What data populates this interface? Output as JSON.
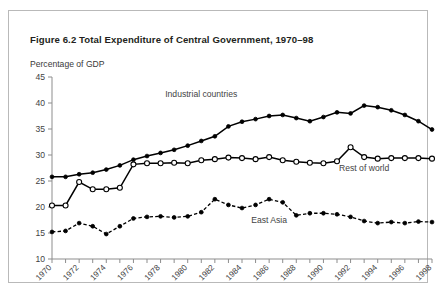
{
  "figure": {
    "title": "Figure 6.2  Total Expenditure of Central Government, 1970–98",
    "subtitle": "Percentage of GDP"
  },
  "chart_data": {
    "type": "line",
    "title": "Figure 6.2  Total Expenditure of Central Government, 1970–98",
    "subtitle": "Percentage of GDP",
    "xlabel": "",
    "ylabel": "Percentage of GDP",
    "ylim": [
      10,
      45
    ],
    "yticks": [
      10,
      15,
      20,
      25,
      30,
      35,
      40,
      45
    ],
    "xlim": [
      1970,
      1998
    ],
    "x": [
      1970,
      1971,
      1972,
      1973,
      1974,
      1975,
      1976,
      1977,
      1978,
      1979,
      1980,
      1981,
      1982,
      1983,
      1984,
      1985,
      1986,
      1987,
      1988,
      1989,
      1990,
      1991,
      1992,
      1993,
      1994,
      1995,
      1996,
      1997,
      1998
    ],
    "xticks": [
      1970,
      1971,
      1972,
      1973,
      1974,
      1975,
      1976,
      1977,
      1978,
      1979,
      1980,
      1981,
      1982,
      1983,
      1984,
      1985,
      1986,
      1987,
      1988,
      1989,
      1990,
      1991,
      1992,
      1993,
      1994,
      1995,
      1996,
      1997,
      1998
    ],
    "xtick_labels_shown": [
      1970,
      1972,
      1974,
      1976,
      1978,
      1980,
      1982,
      1984,
      1986,
      1988,
      1990,
      1992,
      1994,
      1996,
      1998
    ],
    "grid": false,
    "legend": "inline-annotations",
    "series": [
      {
        "name": "Industrial countries",
        "marker": "filled-circle",
        "linestyle": "solid",
        "label_position": "above-line",
        "values": [
          25.8,
          25.8,
          26.3,
          26.6,
          27.2,
          28.0,
          29.1,
          29.8,
          30.4,
          31.0,
          31.8,
          32.7,
          33.6,
          35.5,
          36.4,
          36.9,
          37.5,
          37.7,
          37.1,
          36.5,
          37.3,
          38.2,
          38.0,
          39.5,
          39.2,
          38.6,
          37.7,
          36.5,
          34.9
        ]
      },
      {
        "name": "Rest of world",
        "marker": "open-circle",
        "linestyle": "solid",
        "label_position": "below-line",
        "values": [
          20.3,
          20.3,
          24.8,
          23.4,
          23.4,
          23.7,
          28.2,
          28.4,
          28.4,
          28.5,
          28.4,
          29.0,
          29.2,
          29.5,
          29.4,
          29.2,
          29.6,
          29.0,
          28.7,
          28.5,
          28.4,
          28.8,
          31.5,
          29.6,
          29.3,
          29.4,
          29.4,
          29.4,
          29.3
        ]
      },
      {
        "name": "East Asia",
        "marker": "filled-circle",
        "linestyle": "dashed",
        "label_position": "below-line",
        "values": [
          15.2,
          15.4,
          16.9,
          16.3,
          14.8,
          16.3,
          17.8,
          18.1,
          18.2,
          18.0,
          18.2,
          19.0,
          21.5,
          20.4,
          19.8,
          20.4,
          21.5,
          20.9,
          18.4,
          18.8,
          18.8,
          18.6,
          18.1,
          17.3,
          16.9,
          17.1,
          16.9,
          17.2,
          17.1
        ]
      }
    ],
    "annotations": [
      {
        "text": "Industrial countries",
        "x": 1981,
        "y": 41.2
      },
      {
        "text": "Rest of world",
        "x": 1993,
        "y": 27.0
      },
      {
        "text": "East Asia",
        "x": 1986,
        "y": 16.9
      }
    ]
  }
}
